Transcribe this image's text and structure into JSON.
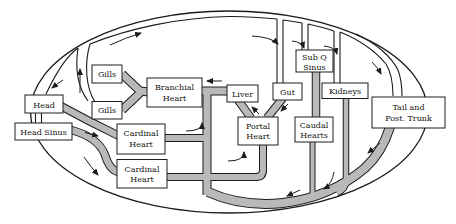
{
  "colors": {
    "vessel": "#b9b9b9",
    "outline": "#1c1c1c",
    "box_fill": "#ffffff",
    "text": "#141414",
    "background": "#ffffff"
  },
  "nodes": {
    "head": {
      "line1": "Head"
    },
    "head_sinus": {
      "line1": "Head Sinus"
    },
    "gills_upper": {
      "line1": "Gills"
    },
    "gills_lower": {
      "line1": "Gills"
    },
    "branchial_heart": {
      "line1": "Branchial",
      "line2": "Heart"
    },
    "cardinal_heart_upper": {
      "line1": "Cardinal",
      "line2": "Heart"
    },
    "cardinal_heart_lower": {
      "line1": "Cardinal",
      "line2": "Heart"
    },
    "liver": {
      "line1": "Liver"
    },
    "portal_heart": {
      "line1": "Portal",
      "line2": "Heart"
    },
    "gut": {
      "line1": "Gut"
    },
    "sub_q_sinus": {
      "line1": "Sub Q",
      "line2": "Sinus"
    },
    "caudal_hearts": {
      "line1": "Caudal",
      "line2": "Hearts"
    },
    "kidneys": {
      "line1": "Kidneys"
    },
    "tail_post_trunk": {
      "line1": "Tail and",
      "line2": "Post. Trunk"
    }
  }
}
